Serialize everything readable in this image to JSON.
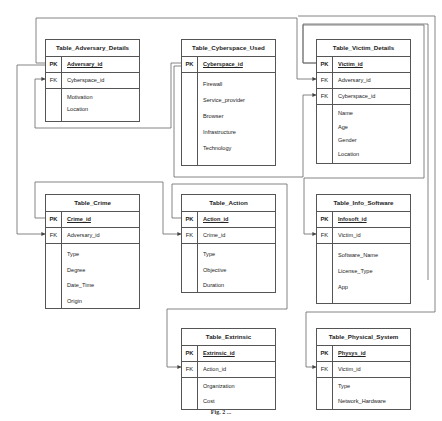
{
  "tables": {
    "adversary": {
      "title": "Table_Adversary_Details",
      "pk": {
        "key": "PK",
        "field": "Adversary_id"
      },
      "fks": [
        {
          "key": "FK",
          "field": "Cyberspace_id"
        }
      ],
      "attrs": [
        "Motivation",
        "Location"
      ]
    },
    "cyberspace": {
      "title": "Table_Cyberspace_Used",
      "pk": {
        "key": "PK",
        "field": "Cyberspace_id"
      },
      "fks": [],
      "attrs": [
        "Firewall",
        "Service_provider",
        "Browser",
        "Infrastructure",
        "Technology"
      ]
    },
    "victim": {
      "title": "Table_Victim_Details",
      "pk": {
        "key": "PK",
        "field": "Victim_id"
      },
      "fks": [
        {
          "key": "FK",
          "field": "Adversary_id"
        },
        {
          "key": "FK",
          "field": "Cyberspace_id"
        }
      ],
      "attrs": [
        "Name",
        "Age",
        "Gender",
        "Location"
      ]
    },
    "crime": {
      "title": "Table_Crime",
      "pk": {
        "key": "PK",
        "field": "Crime_id"
      },
      "fks": [
        {
          "key": "FK",
          "field": "Adversary_id"
        }
      ],
      "attrs": [
        "Type",
        "Degree",
        "Date_Time",
        "Origin"
      ]
    },
    "action": {
      "title": "Table_Action",
      "pk": {
        "key": "PK",
        "field": "Action_id"
      },
      "fks": [
        {
          "key": "FK",
          "field": "Crime_id"
        }
      ],
      "attrs": [
        "Type",
        "Objective",
        "Duration"
      ]
    },
    "info_software": {
      "title": "Table_Info_Software",
      "pk": {
        "key": "PK",
        "field": "Infosoft_id"
      },
      "fks": [
        {
          "key": "FK",
          "field": "Victim_id"
        }
      ],
      "attrs": [
        "Software_Name",
        "License_Type",
        "App"
      ]
    },
    "extrinsic": {
      "title": "Table_Extrinsic",
      "pk": {
        "key": "PK",
        "field": "Extrinsic_id"
      },
      "fks": [
        {
          "key": "FK",
          "field": "Action_id"
        }
      ],
      "attrs": [
        "Organization",
        "Cost"
      ]
    },
    "physical": {
      "title": "Table_Physical_System",
      "pk": {
        "key": "PK",
        "field": "Physys_id"
      },
      "fks": [
        {
          "key": "FK",
          "field": "Victim_id"
        }
      ],
      "attrs": [
        "Type",
        "Network_Hardware"
      ]
    }
  },
  "caption": "Fig. 2 ..."
}
